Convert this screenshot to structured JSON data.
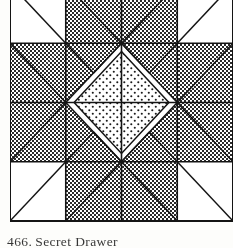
{
  "page": {
    "background_color": "#fdfdfb",
    "ink_color": "#1a1a1a"
  },
  "caption": {
    "number": "466.",
    "name": "Secret Drawer",
    "full_text": "466. Secret Drawer"
  },
  "figure": {
    "grid": {
      "rows": 4,
      "cols": 4,
      "line_color": "#141414",
      "line_width": 1.6,
      "outer_line_width": 2.0
    },
    "fills": {
      "light": "#ffffff",
      "dark_crosshatch": "#6b6b6b",
      "dotted_stipple": "#ffffff",
      "dot_color": "#1a1a1a"
    },
    "legend": [
      {
        "key": "dark",
        "label": "dark crosshatch patch"
      },
      {
        "key": "dotted",
        "label": "dotted stipple patch"
      },
      {
        "key": "light",
        "label": "plain light patch"
      }
    ]
  }
}
